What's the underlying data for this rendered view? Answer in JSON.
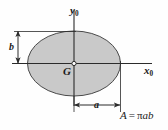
{
  "figure": {
    "type": "ellipse-centroid-diagram",
    "shape_name": "ellipse",
    "axes": {
      "y_axis_label": "y",
      "y_axis_subscript": "0",
      "x_axis_label": "x",
      "x_axis_subscript": "0"
    },
    "centroid": {
      "label": "G",
      "marker": "open-circle"
    },
    "dimensions": [
      {
        "name": "semi-minor-axis",
        "label": "b",
        "orientation": "vertical",
        "position": "left"
      },
      {
        "name": "semi-major-axis",
        "label": "a",
        "orientation": "horizontal",
        "position": "bottom"
      }
    ],
    "formula": {
      "lhs": "A",
      "operator": "=",
      "rhs_pi": "π",
      "rhs_vars": "ab",
      "full": "A = πab"
    },
    "colors": {
      "fill": "#c9c9c9",
      "outline": "#4a4a4a",
      "line": "#2b2b2b",
      "text": "#1a1a1a",
      "background": "#fefefe"
    }
  }
}
